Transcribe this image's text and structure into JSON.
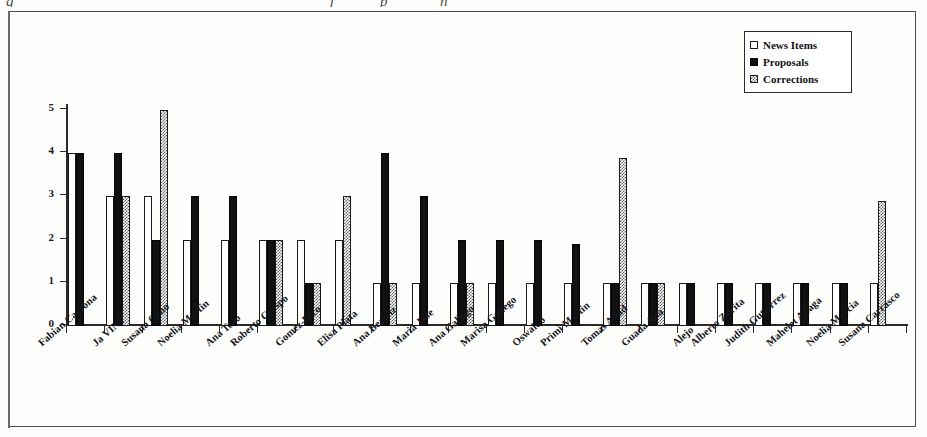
{
  "figure": {
    "top_caption_fragments": [
      "g",
      "f",
      "p",
      "n"
    ],
    "background_color": "#fdfdfc",
    "frame_color": "#4e4e52"
  },
  "legend": {
    "position": "top-right",
    "entries": [
      {
        "label": "News Items",
        "swatch": "white-outline",
        "color": "#ffffff"
      },
      {
        "label": "Proposals",
        "swatch": "black-fill",
        "color": "#111111"
      },
      {
        "label": "Corrections",
        "swatch": "gray-dither",
        "color": "#8a8a8a"
      }
    ]
  },
  "chart_data": {
    "type": "bar",
    "title": "",
    "subtitle": "",
    "xlabel": "",
    "ylabel": "",
    "ylim": [
      0,
      5
    ],
    "yticks": [
      "0",
      "1",
      "2",
      "3",
      "4",
      "5"
    ],
    "grid": false,
    "legend_position": "top-right",
    "orientation": "vertical",
    "grouping": "grouped",
    "categories": [
      "Fabian Carrona",
      "Ja VINT",
      "Susana Cano",
      "Noelia Martin",
      "Ana Toro",
      "Roberto Crespo",
      "Gomez-Rico",
      "Elisa Plata",
      "Ana Beatriz",
      "Maria Jose",
      "Ana Gallego",
      "Marisa Gallego",
      "Oswaldo",
      "Primi Martin",
      "Tomas Abad",
      "Guada Ana",
      "Alejo",
      "Alberto Zurita",
      "Judith Gutierrez",
      "Mahelet Aliaga",
      "Noelia Murcia",
      "Susana Carrasco"
    ],
    "series": [
      {
        "name": "News Items",
        "color": "#ffffff",
        "values": [
          4,
          3,
          3,
          2,
          2,
          2,
          2,
          2,
          1,
          1,
          1,
          1,
          1,
          1,
          1,
          1,
          1,
          1,
          1,
          1,
          1,
          1
        ]
      },
      {
        "name": "Proposals",
        "color": "#111111",
        "values": [
          4,
          4,
          2,
          3,
          3,
          2,
          1,
          0,
          4,
          3,
          2,
          2,
          2,
          1.9,
          1,
          1,
          1,
          1,
          1,
          1,
          1,
          0
        ]
      },
      {
        "name": "Corrections",
        "color": "#8a8a8a",
        "values": [
          0,
          3,
          5,
          0,
          0,
          2,
          1,
          3,
          1,
          0,
          1,
          0,
          0,
          0,
          3.9,
          1,
          0,
          0,
          0,
          0,
          0,
          2.9
        ]
      }
    ]
  }
}
